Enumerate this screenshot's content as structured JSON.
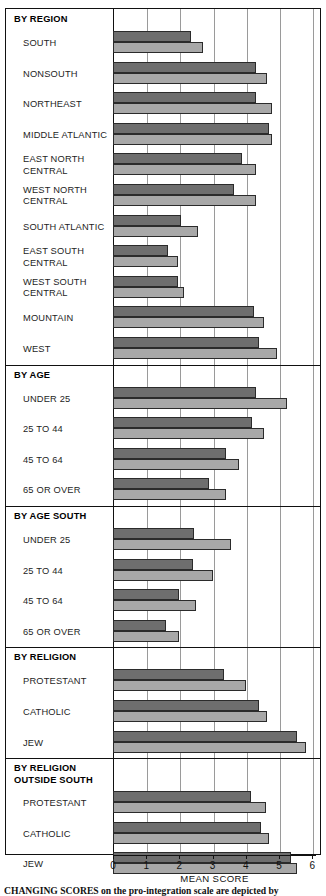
{
  "chart_data": {
    "type": "bar",
    "title": "",
    "xlabel": "MEAN SCORE",
    "ylabel": "",
    "xlim": [
      0,
      6
    ],
    "xticks": [
      0,
      1,
      2,
      3,
      4,
      5,
      6
    ],
    "xticklabels": [
      "0",
      "1",
      "2",
      "3",
      "4",
      "5",
      "6"
    ],
    "grid": true,
    "orientation": "horizontal",
    "legend_position": "none",
    "series": [
      {
        "name": "first-period",
        "shade": "dark"
      },
      {
        "name": "second-period",
        "shade": "light"
      }
    ],
    "sections": [
      {
        "header": "BY REGION",
        "rows": [
          {
            "label": "SOUTH",
            "values": [
              2.35,
              2.7
            ]
          },
          {
            "label": "NONSOUTH",
            "values": [
              4.3,
              4.65
            ]
          },
          {
            "label": "NORTHEAST",
            "values": [
              4.3,
              4.8
            ]
          },
          {
            "label": "MIDDLE ATLANTIC",
            "values": [
              4.7,
              4.8
            ]
          },
          {
            "label": "EAST NORTH CENTRAL",
            "values": [
              3.9,
              4.3
            ]
          },
          {
            "label": "WEST NORTH CENTRAL",
            "values": [
              3.65,
              4.3
            ]
          },
          {
            "label": "SOUTH ATLANTIC",
            "values": [
              2.05,
              2.55
            ]
          },
          {
            "label": "EAST SOUTH CENTRAL",
            "values": [
              1.65,
              1.95
            ]
          },
          {
            "label": "WEST SOUTH CENTRAL",
            "values": [
              1.95,
              2.15
            ]
          },
          {
            "label": "MOUNTAIN",
            "values": [
              4.25,
              4.55
            ]
          },
          {
            "label": "WEST",
            "values": [
              4.4,
              4.95
            ]
          }
        ]
      },
      {
        "header": "BY AGE",
        "rows": [
          {
            "label": "UNDER 25",
            "values": [
              4.3,
              5.25
            ]
          },
          {
            "label": "25 TO 44",
            "values": [
              4.2,
              4.55
            ]
          },
          {
            "label": "45 TO 64",
            "values": [
              3.4,
              3.8
            ]
          },
          {
            "label": "65 OR OVER",
            "values": [
              2.9,
              3.4
            ]
          }
        ]
      },
      {
        "header": "BY AGE SOUTH",
        "rows": [
          {
            "label": "UNDER 25",
            "values": [
              2.45,
              3.55
            ]
          },
          {
            "label": "25 TO 44",
            "values": [
              2.4,
              3.0
            ]
          },
          {
            "label": "45 TO 64",
            "values": [
              2.0,
              2.5
            ]
          },
          {
            "label": "65 OR OVER",
            "values": [
              1.6,
              2.0
            ]
          }
        ]
      },
      {
        "header": "BY RELIGION",
        "rows": [
          {
            "label": "PROTESTANT",
            "values": [
              3.35,
              4.0
            ]
          },
          {
            "label": "CATHOLIC",
            "values": [
              4.4,
              4.65
            ]
          },
          {
            "label": "JEW",
            "values": [
              5.55,
              5.8
            ]
          }
        ]
      },
      {
        "header": "BY RELIGION OUTSIDE SOUTH",
        "rows": [
          {
            "label": "PROTESTANT",
            "values": [
              4.15,
              4.6
            ]
          },
          {
            "label": "CATHOLIC",
            "values": [
              4.45,
              4.7
            ]
          },
          {
            "label": "JEW",
            "values": [
              5.35,
              5.55
            ]
          }
        ]
      }
    ]
  },
  "axis": {
    "title": "MEAN SCORE",
    "ticklabels": [
      "0",
      "1",
      "2",
      "3",
      "4",
      "5",
      "6"
    ]
  },
  "caption": {
    "lead": "CHANGING SCORES",
    "rest": " on the pro-integration scale are depicted by"
  },
  "colors": {
    "bar_dark": "#6e6e6e",
    "bar_light": "#a8a8a8",
    "bar_outline": "#2b2b2b",
    "gridline": "#9a9a9a",
    "frame": "#111111",
    "text": "#1d1d1d"
  }
}
